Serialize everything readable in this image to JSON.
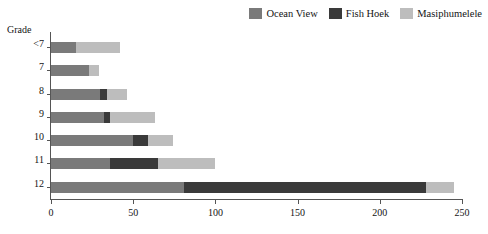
{
  "chart_data": {
    "type": "bar",
    "orientation": "horizontal",
    "stacked": true,
    "title": "",
    "subtitle": "",
    "xlabel": "",
    "ylabel": "Grade",
    "categories": [
      "<7",
      "7",
      "8",
      "9",
      "10",
      "11",
      "12"
    ],
    "series": [
      {
        "name": "Ocean View",
        "color": "#7a7a7a",
        "values": [
          15,
          23,
          30,
          32,
          50,
          36,
          81
        ]
      },
      {
        "name": "Fish Hoek",
        "color": "#3a3a3a",
        "values": [
          0,
          0,
          4,
          4,
          9,
          29,
          147
        ]
      },
      {
        "name": "Masiphumelele",
        "color": "#bdbdbd",
        "values": [
          27,
          6,
          12,
          27,
          15,
          35,
          17
        ]
      }
    ],
    "totals": [
      42,
      29,
      46,
      63,
      74,
      100,
      245
    ],
    "xlim": [
      0,
      250
    ],
    "xticks": [
      0,
      50,
      100,
      150,
      200,
      250
    ],
    "xtick_labels": [
      "0",
      "50",
      "100",
      "150",
      "200",
      "250"
    ],
    "grid": false,
    "legend_position": "top-right"
  },
  "legend": {
    "items": [
      {
        "label": "Ocean View",
        "color": "#7a7a7a"
      },
      {
        "label": "Fish Hoek",
        "color": "#3a3a3a"
      },
      {
        "label": "Masiphumelele",
        "color": "#bdbdbd"
      }
    ]
  },
  "axes": {
    "y_title": "Grade"
  }
}
